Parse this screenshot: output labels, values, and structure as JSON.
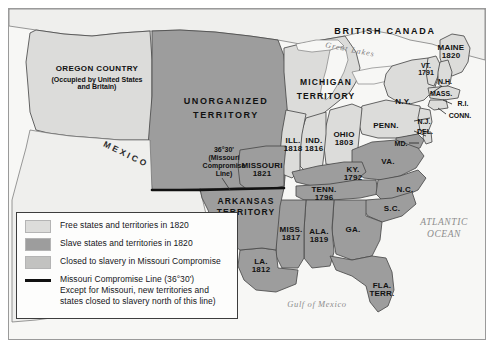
{
  "map": {
    "title_regions": {
      "british_canada": "BRITISH CANADA",
      "great_lakes": "Great Lakes",
      "oregon_country": "OREGON COUNTRY",
      "oregon_sub": "(Occupied by United States\nand Britain)",
      "unorganized_territory": "UNORGANIZED\nTERRITORY",
      "michigan_territory_1": "MICHIGAN",
      "michigan_territory_2": "TERRITORY",
      "arkansas_territory": "ARKANSAS\nTERRITORY",
      "mexico": "MEXICO",
      "atlantic_ocean": "ATLANTIC\nOCEAN",
      "gulf_of_mexico": "Gulf of Mexico",
      "compromise_annotation": "36°30'\n(Missouri\nCompromise\nLine)"
    },
    "states": [
      {
        "name": "MAINE",
        "year": "1820",
        "status": "free"
      },
      {
        "name": "VT.",
        "year": "1791",
        "status": "free"
      },
      {
        "name": "N.H.",
        "year": "",
        "status": "free"
      },
      {
        "name": "MASS.",
        "year": "",
        "status": "free"
      },
      {
        "name": "R.I.",
        "year": "",
        "status": "free"
      },
      {
        "name": "CONN.",
        "year": "",
        "status": "free"
      },
      {
        "name": "N.Y.",
        "year": "",
        "status": "free"
      },
      {
        "name": "PENN.",
        "year": "",
        "status": "free"
      },
      {
        "name": "N.J.",
        "year": "",
        "status": "free"
      },
      {
        "name": "DEL.",
        "year": "",
        "status": "free"
      },
      {
        "name": "MD.",
        "year": "",
        "status": "slave"
      },
      {
        "name": "VA.",
        "year": "",
        "status": "slave"
      },
      {
        "name": "OHIO",
        "year": "1803",
        "status": "free"
      },
      {
        "name": "IND.",
        "year": "1816",
        "status": "free"
      },
      {
        "name": "ILL.",
        "year": "1818",
        "status": "free"
      },
      {
        "name": "KY.",
        "year": "1792",
        "status": "slave"
      },
      {
        "name": "MISSOURI",
        "year": "1821",
        "status": "slave"
      },
      {
        "name": "TENN.",
        "year": "1796",
        "status": "slave"
      },
      {
        "name": "N.C.",
        "year": "",
        "status": "slave"
      },
      {
        "name": "S.C.",
        "year": "",
        "status": "slave"
      },
      {
        "name": "GA.",
        "year": "",
        "status": "slave"
      },
      {
        "name": "ALA.",
        "year": "1819",
        "status": "slave"
      },
      {
        "name": "MISS.",
        "year": "1817",
        "status": "slave"
      },
      {
        "name": "LA.",
        "year": "1812",
        "status": "slave"
      },
      {
        "name": "FLA.",
        "year": "TERR.",
        "status": "slave"
      }
    ],
    "labels": {
      "maine": "MAINE\n1820",
      "vt": "VT.\n1791",
      "nh": "N.H.",
      "mass": "MASS.",
      "ri": "R.I.",
      "conn": "CONN.",
      "ny": "N.Y.",
      "penn": "PENN.",
      "nj": "N.J.",
      "del": "DEL.",
      "md": "MD.",
      "va": "VA.",
      "ohio": "OHIO\n1803",
      "ind": "IND.\n1816",
      "ill": "ILL.\n1818",
      "ky": "KY.\n1792",
      "missouri": "MISSOURI\n1821",
      "tenn": "TENN.\n1796",
      "nc": "N.C.",
      "sc": "S.C.",
      "ga": "GA.",
      "ala": "ALA.\n1819",
      "miss": "MISS.\n1817",
      "la": "LA.\n1812",
      "fla": "FLA.\nTERR."
    }
  },
  "legend": {
    "items": [
      {
        "swatch": "free",
        "label": "Free states and territories in 1820"
      },
      {
        "swatch": "slave",
        "label": "Slave states and territories in 1820"
      },
      {
        "swatch": "closed",
        "label": "Closed to slavery in Missouri Compromise"
      }
    ],
    "line_item": {
      "line1": "Missouri Compromise Line (36°30')",
      "line2": "Except for Missouri, new territories and",
      "line3": "states closed to slavery north of this line)"
    }
  },
  "colors": {
    "free": "#dcdcda",
    "slave": "#9d9d9d",
    "closed": "#c2c2c0",
    "unclaimed": "#efefed",
    "water": "#f7f7f5",
    "outline": "#4a4a4a",
    "compromise_line": "#111111",
    "ocean_text": "#8d8d8d"
  }
}
